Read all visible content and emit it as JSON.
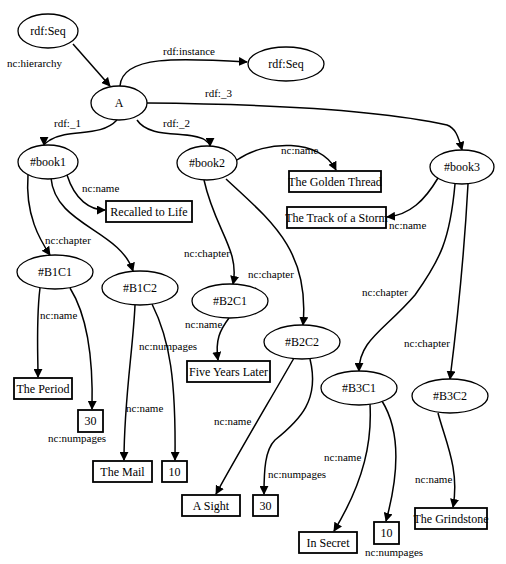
{
  "diagram": {
    "nodes": [
      {
        "id": "seq_top",
        "label": "rdf:Seq",
        "shape": "ellipse",
        "x": 48,
        "y": 31,
        "rx": 30,
        "ry": 17
      },
      {
        "id": "seq_inst",
        "label": "rdf:Seq",
        "shape": "ellipse",
        "x": 286,
        "y": 64,
        "rx": 38,
        "ry": 17
      },
      {
        "id": "A",
        "label": "A",
        "shape": "ellipse",
        "x": 119,
        "y": 103,
        "rx": 28,
        "ry": 17
      },
      {
        "id": "book1",
        "label": "#book1",
        "shape": "ellipse",
        "x": 48,
        "y": 162,
        "rx": 30,
        "ry": 17
      },
      {
        "id": "book2",
        "label": "#book2",
        "shape": "ellipse",
        "x": 207,
        "y": 163,
        "rx": 30,
        "ry": 17
      },
      {
        "id": "book3",
        "label": "#book3",
        "shape": "ellipse",
        "x": 462,
        "y": 167,
        "rx": 32,
        "ry": 17
      },
      {
        "id": "title1",
        "label": "Recalled to Life",
        "shape": "rect",
        "x": 106,
        "y": 201,
        "w": 86,
        "h": 21
      },
      {
        "id": "title2",
        "label": "The Golden Thread",
        "shape": "rect",
        "x": 289,
        "y": 171,
        "w": 92,
        "h": 21
      },
      {
        "id": "title3",
        "label": "The Track of a Storm",
        "shape": "rect",
        "x": 287,
        "y": 207,
        "w": 99,
        "h": 21
      },
      {
        "id": "B1C1",
        "label": "#B1C1",
        "shape": "ellipse",
        "x": 55,
        "y": 272,
        "rx": 38,
        "ry": 17
      },
      {
        "id": "B1C2",
        "label": "#B1C2",
        "shape": "ellipse",
        "x": 140,
        "y": 288,
        "rx": 38,
        "ry": 17
      },
      {
        "id": "B2C1",
        "label": "#B2C1",
        "shape": "ellipse",
        "x": 230,
        "y": 301,
        "rx": 38,
        "ry": 17
      },
      {
        "id": "B2C2",
        "label": "#B2C2",
        "shape": "ellipse",
        "x": 302,
        "y": 342,
        "rx": 38,
        "ry": 17
      },
      {
        "id": "B3C1",
        "label": "#B3C1",
        "shape": "ellipse",
        "x": 359,
        "y": 388,
        "rx": 38,
        "ry": 17
      },
      {
        "id": "B3C2",
        "label": "#B3C2",
        "shape": "ellipse",
        "x": 450,
        "y": 396,
        "rx": 38,
        "ry": 17
      },
      {
        "id": "lit_period",
        "label": "The Period",
        "shape": "rect",
        "x": 14,
        "y": 378,
        "w": 58,
        "h": 21
      },
      {
        "id": "lit_30a",
        "label": "30",
        "shape": "rect",
        "x": 78,
        "y": 410,
        "w": 25,
        "h": 22
      },
      {
        "id": "lit_mail",
        "label": "The Mail",
        "shape": "rect",
        "x": 93,
        "y": 461,
        "w": 59,
        "h": 21
      },
      {
        "id": "lit_10a",
        "label": "10",
        "shape": "rect",
        "x": 162,
        "y": 461,
        "w": 25,
        "h": 21
      },
      {
        "id": "lit_fiveyears",
        "label": "Five Years Later",
        "shape": "rect",
        "x": 187,
        "y": 361,
        "w": 83,
        "h": 21
      },
      {
        "id": "lit_asight",
        "label": "A Sight",
        "shape": "rect",
        "x": 182,
        "y": 495,
        "w": 58,
        "h": 21
      },
      {
        "id": "lit_30b",
        "label": "30",
        "shape": "rect",
        "x": 253,
        "y": 495,
        "w": 25,
        "h": 21
      },
      {
        "id": "lit_insecret",
        "label": "In Secret",
        "shape": "rect",
        "x": 299,
        "y": 532,
        "w": 58,
        "h": 21
      },
      {
        "id": "lit_10b",
        "label": "10",
        "shape": "rect",
        "x": 374,
        "y": 522,
        "w": 25,
        "h": 22
      },
      {
        "id": "lit_grindstone",
        "label": "The Grindstone",
        "shape": "rect",
        "x": 415,
        "y": 508,
        "w": 72,
        "h": 21
      }
    ],
    "edges": [
      {
        "label": "nc:hierarchy",
        "d": "M 73 44 L 110 86",
        "lx": 7,
        "ly": 67,
        "anchor": "start"
      },
      {
        "label": "rdf:instance",
        "d": "M 120 86 C 122 55, 180 58, 247 62",
        "lx": 163,
        "ly": 55,
        "anchor": "start"
      },
      {
        "label": "rdf:_3",
        "d": "M 147 103 C 260 104, 380 110, 447 125 C 455 128, 458 135, 462 150",
        "lx": 205,
        "ly": 97,
        "anchor": "start"
      },
      {
        "label": "rdf:_1",
        "d": "M 117 120 C 100 138, 70 128, 50 140 C 44 144, 44 145, 44 145",
        "lx": 54,
        "ly": 127,
        "anchor": "start"
      },
      {
        "label": "rdf:_2",
        "d": "M 137 120 C 150 140, 190 130, 205 140 C 209 143, 210 145, 210 146",
        "lx": 163,
        "ly": 127,
        "anchor": "start"
      },
      {
        "label": "nc:name",
        "d": "M 67 175 C 75 200, 90 210, 105 210",
        "lx": 82,
        "ly": 192,
        "anchor": "start"
      },
      {
        "label": "nc:chapter",
        "d": "M 28 175 C 25 215, 40 240, 50 255",
        "lx": 45,
        "ly": 244,
        "anchor": "start"
      },
      {
        "label": "",
        "d": "M 51 178 C 55 225, 120 230, 133 271",
        "lx": 0,
        "ly": 0,
        "anchor": "start"
      },
      {
        "label": "nc:name",
        "d": "M 237 160 C 265 140, 320 138, 336 170",
        "lx": 281,
        "ly": 154,
        "anchor": "start"
      },
      {
        "label": "nc:name",
        "d": "M 438 178 C 425 200, 410 215, 387 217",
        "lx": 389,
        "ly": 229,
        "anchor": "start"
      },
      {
        "label": "nc:chapter",
        "d": "M 204 180 C 215 230, 240 250, 233 284",
        "lx": 184,
        "ly": 257,
        "anchor": "start"
      },
      {
        "label": "nc:chapter",
        "d": "M 226 179 C 270 220, 310 250, 303 325",
        "lx": 248,
        "ly": 278,
        "anchor": "start"
      },
      {
        "label": "nc:chapter",
        "d": "M 455 184 C 450 240, 440 260, 415 295 C 385 330, 359 340, 359 371",
        "lx": 362,
        "ly": 296,
        "anchor": "start"
      },
      {
        "label": "nc:chapter",
        "d": "M 468 184 C 465 240, 460 300, 450 379",
        "lx": 404,
        "ly": 347,
        "anchor": "start"
      },
      {
        "label": "nc:name",
        "d": "M 40 288 C 36 320, 38 355, 38 377",
        "lx": 40,
        "ly": 319,
        "anchor": "start"
      },
      {
        "label": "nc:numpages",
        "d": "M 70 288 C 90 320, 93 370, 92 409",
        "lx": 48,
        "ly": 442,
        "anchor": "start"
      },
      {
        "label": "nc:name",
        "d": "M 135 305 C 133 350, 124 400, 124 460",
        "lx": 126,
        "ly": 412,
        "anchor": "start"
      },
      {
        "label": "nc:numpages",
        "d": "M 152 304 C 170 340, 176 380, 175 460",
        "lx": 139,
        "ly": 350,
        "anchor": "start"
      },
      {
        "label": "nc:name",
        "d": "M 229 318 C 220 330, 215 340, 218 360",
        "lx": 185,
        "ly": 328,
        "anchor": "start"
      },
      {
        "label": "nc:name",
        "d": "M 294 358 C 270 400, 240 450, 216 494",
        "lx": 214,
        "ly": 425,
        "anchor": "start"
      },
      {
        "label": "nc:numpages",
        "d": "M 310 359 C 320 400, 300 420, 275 440 C 265 450, 264 470, 264 494",
        "lx": 268,
        "ly": 478,
        "anchor": "start"
      },
      {
        "label": "nc:name",
        "d": "M 370 404 C 372 440, 365 480, 334 531",
        "lx": 324,
        "ly": 461,
        "anchor": "start"
      },
      {
        "label": "nc:numpages",
        "d": "M 382 401 C 400 430, 400 470, 386 521",
        "lx": 365,
        "ly": 556,
        "anchor": "start"
      },
      {
        "label": "nc:name",
        "d": "M 438 413 C 445 440, 460 470, 453 507",
        "lx": 415,
        "ly": 483,
        "anchor": "start"
      }
    ]
  }
}
